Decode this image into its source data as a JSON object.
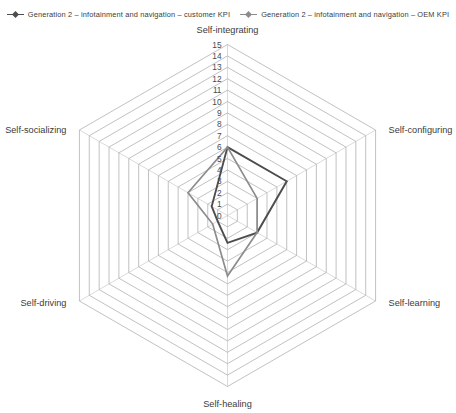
{
  "legend": {
    "entries": [
      {
        "label": "Generation 2 – infotainment and navigation – customer KPI",
        "color": "#4d4d4d",
        "marker": "line-diamond-marker"
      },
      {
        "label": "Generation 2 – infotainment and navigation – OEM KPI",
        "color": "#8c8c8c",
        "marker": "line-diamond-marker"
      }
    ]
  },
  "chart_data": {
    "type": "radar",
    "title": "",
    "categories": [
      "Self-integrating",
      "Self-configuring",
      "Self-learning",
      "Self-healing",
      "Self-driving",
      "Self-socializing"
    ],
    "tick_labels": [
      "0",
      "1",
      "2",
      "3",
      "4",
      "5",
      "6",
      "7",
      "8",
      "9",
      "10",
      "11",
      "12",
      "13",
      "14",
      "15"
    ],
    "rlim": [
      0,
      15
    ],
    "rticks": [
      0,
      1,
      2,
      3,
      4,
      5,
      6,
      7,
      8,
      9,
      10,
      11,
      12,
      13,
      14,
      15
    ],
    "grid": true,
    "grid_shape": "polygon",
    "legend_position": "top",
    "xlabel": "",
    "ylabel": "",
    "series": [
      {
        "name": "Generation 2 – infotainment and navigation – customer KPI",
        "color": "#4d4d4d",
        "values": [
          6,
          6,
          3,
          2.4,
          1,
          1.6
        ]
      },
      {
        "name": "Generation 2 – infotainment and navigation – OEM KPI",
        "color": "#8c8c8c",
        "values": [
          6,
          3,
          3,
          5.3,
          1.5,
          4
        ]
      }
    ]
  }
}
